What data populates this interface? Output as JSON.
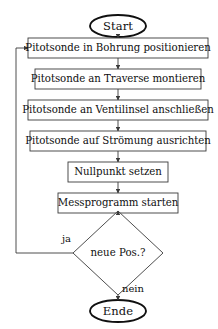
{
  "diagram": {
    "type": "flowchart",
    "language": "de",
    "colors": {
      "background": "#ffffff",
      "stroke": "#3a3a3a",
      "terminal_stroke": "#101010",
      "text": "#101010"
    },
    "nodes": [
      {
        "id": "start",
        "shape": "ellipse",
        "label": "Start",
        "cx": 118,
        "cy": 26,
        "rx": 28,
        "ry": 11
      },
      {
        "id": "p1",
        "shape": "rect",
        "label": "Pitotsonde in Bohrung positionieren",
        "x": 28,
        "y": 38,
        "w": 180,
        "h": 20
      },
      {
        "id": "p2",
        "shape": "rect",
        "label": "Pitotsonde an Traverse montieren",
        "x": 35,
        "y": 69,
        "w": 166,
        "h": 20
      },
      {
        "id": "p3",
        "shape": "rect",
        "label": "Pitotsonde an Ventilinsel anschließen",
        "x": 28,
        "y": 100,
        "w": 180,
        "h": 20
      },
      {
        "id": "p4",
        "shape": "rect",
        "label": "Pitotsonde auf Strömung ausrichten",
        "x": 30,
        "y": 131,
        "w": 176,
        "h": 20
      },
      {
        "id": "p5",
        "shape": "rect",
        "label": "Nullpunkt setzen",
        "x": 68,
        "y": 162,
        "w": 100,
        "h": 20
      },
      {
        "id": "p6",
        "shape": "rect",
        "label": "Messprogramm starten",
        "x": 58,
        "y": 193,
        "w": 120,
        "h": 20
      },
      {
        "id": "d1",
        "shape": "diamond",
        "label": "neue Pos.?",
        "cx": 118,
        "cy": 253,
        "rx": 45,
        "ry": 42
      },
      {
        "id": "end",
        "shape": "ellipse",
        "label": "Ende",
        "cx": 118,
        "cy": 311,
        "rx": 28,
        "ry": 11
      }
    ],
    "edges": [
      {
        "id": "e-start-p1",
        "from": "start",
        "to": "p1",
        "label": ""
      },
      {
        "id": "e-p1-p2",
        "from": "p1",
        "to": "p2",
        "label": ""
      },
      {
        "id": "e-p2-p3",
        "from": "p2",
        "to": "p3",
        "label": ""
      },
      {
        "id": "e-p3-p4",
        "from": "p3",
        "to": "p4",
        "label": ""
      },
      {
        "id": "e-p4-p5",
        "from": "p4",
        "to": "p5",
        "label": ""
      },
      {
        "id": "e-p5-p6",
        "from": "p5",
        "to": "p6",
        "label": ""
      },
      {
        "id": "e-p6-d1",
        "from": "p6",
        "to": "d1",
        "label": ""
      },
      {
        "id": "e-d1-p1",
        "from": "d1",
        "to": "p1",
        "label": "ja"
      },
      {
        "id": "e-d1-end",
        "from": "d1",
        "to": "end",
        "label": "nein"
      }
    ],
    "edge_labels": {
      "yes": "ja",
      "no": "nein"
    }
  }
}
